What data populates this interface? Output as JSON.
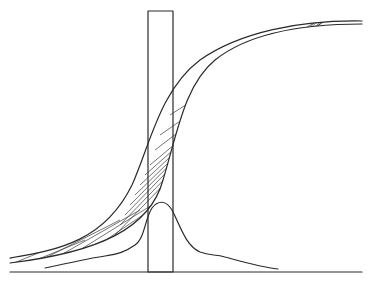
{
  "diagram": {
    "type": "line-drawing",
    "colors": {
      "ink": "#2a2a2a",
      "background": "#ffffff"
    },
    "elements": [
      {
        "name": "baseline",
        "shape": "horizontal line",
        "from": [
          10,
          272
        ],
        "to": [
          362,
          272
        ]
      },
      {
        "name": "vertical-band",
        "shape": "rectangle",
        "x": 148,
        "y": 11,
        "width": 25,
        "height": 261
      },
      {
        "name": "upper-sigmoid-curve",
        "shape": "S-curve",
        "from": [
          10,
          258
        ],
        "to": [
          362,
          21
        ]
      },
      {
        "name": "lower-sigmoid-curve",
        "shape": "S-curve",
        "from": [
          10,
          263
        ],
        "to": [
          362,
          24
        ]
      },
      {
        "name": "hatched-region",
        "shape": "diagonal hatch between sigmoid curves"
      },
      {
        "name": "bell-curve",
        "shape": "peaked distribution",
        "from": [
          45,
          268
        ],
        "peak": [
          161,
          203
        ],
        "to": [
          278,
          269
        ]
      }
    ]
  }
}
